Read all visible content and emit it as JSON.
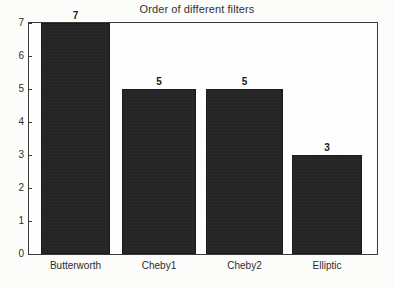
{
  "chart_data": {
    "type": "bar",
    "title": "Order of different filters",
    "xlabel": "",
    "ylabel": "",
    "categories": [
      "Butterworth",
      "Cheby1",
      "Cheby2",
      "Elliptic"
    ],
    "values": [
      7,
      5,
      5,
      3
    ],
    "value_labels": [
      "7",
      "5",
      "5",
      "3"
    ],
    "ylim": [
      0,
      7
    ],
    "ytick_labels": [
      "0",
      "1",
      "2",
      "3",
      "4",
      "5",
      "6",
      "7"
    ],
    "ytick_values": [
      0,
      1,
      2,
      3,
      4,
      5,
      6,
      7
    ],
    "grid": false,
    "legend": false,
    "bar_color": "#242424",
    "frame_color": "#3a3a3a",
    "background_color": "#fefefe"
  }
}
